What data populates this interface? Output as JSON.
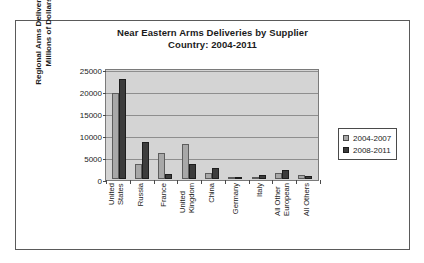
{
  "chart_data": {
    "type": "bar",
    "title": "Near Eastern Arms Deliveries by Supplier Country: 2004-2011",
    "title_line1": "Near Eastern Arms Deliveries by Supplier",
    "title_line2": "Country: 2004-2011",
    "xlabel": "",
    "ylabel": "Regional Arms Deliveries in Millions of Dollars",
    "ylabel_line1": "Regional Arms Deliveries in",
    "ylabel_line2": "Millions of Dollars",
    "ylim": [
      0,
      25000
    ],
    "yticks": [
      0,
      5000,
      10000,
      15000,
      20000,
      25000
    ],
    "ytick_labels": [
      "0",
      "5000",
      "10000",
      "15000",
      "20000",
      "25000"
    ],
    "grid": true,
    "legend_position": "right",
    "plot_background": "#d4d4d4",
    "categories": [
      "United States",
      "Russia",
      "France",
      "United Kingdom",
      "China",
      "Germany",
      "Italy",
      "All Other European",
      "All Others"
    ],
    "category_lines": [
      [
        "United",
        "States"
      ],
      [
        "Russia",
        ""
      ],
      [
        "France",
        ""
      ],
      [
        "United",
        "Kingdom"
      ],
      [
        "China",
        ""
      ],
      [
        "Germany",
        ""
      ],
      [
        "Italy",
        ""
      ],
      [
        "All Other",
        "European"
      ],
      [
        "All Others",
        ""
      ]
    ],
    "series": [
      {
        "name": "2004-2007",
        "color": "#a8a8a8",
        "values": [
          19500,
          3400,
          6000,
          7900,
          1300,
          500,
          200,
          1400,
          1000
        ]
      },
      {
        "name": "2008-2011",
        "color": "#3c3c3c",
        "values": [
          22800,
          8500,
          1100,
          3400,
          2600,
          500,
          900,
          2000,
          700
        ]
      }
    ]
  }
}
